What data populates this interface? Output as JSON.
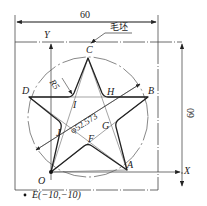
{
  "dimensions": {
    "width_label": "60",
    "height_label": "60",
    "diameter_label": "φ52.573",
    "radius_label": "R5"
  },
  "annotations": {
    "blank_label": "毛坯",
    "point_e": "E(−10,−10)"
  },
  "axes": {
    "x": "X",
    "y": "Y",
    "origin": "O"
  },
  "points": {
    "A": "A",
    "B": "B",
    "C": "C",
    "D": "D",
    "F": "F",
    "G": "G",
    "H": "H",
    "I": "I",
    "J": "J"
  },
  "colors": {
    "line": "#222222",
    "thin": "#555555",
    "background": "#ffffff"
  }
}
